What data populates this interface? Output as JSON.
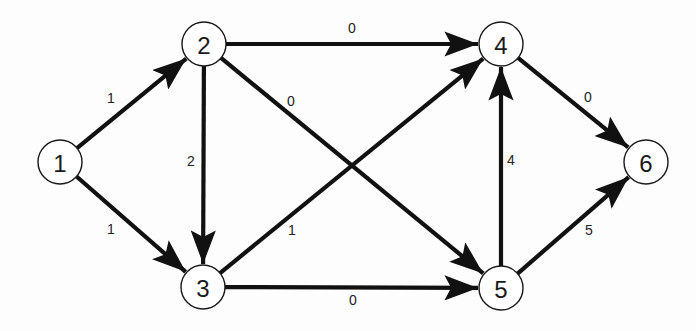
{
  "diagram": {
    "type": "directed-weighted-graph",
    "colors": {
      "edge": "#111111",
      "node_stroke": "#1a1a1a",
      "node_fill": "#ffffff",
      "text": "#1a1a1a",
      "background": "#fdfdfd"
    },
    "nodes": [
      {
        "id": "1",
        "label": "1",
        "x": 60,
        "y": 162
      },
      {
        "id": "2",
        "label": "2",
        "x": 204,
        "y": 44
      },
      {
        "id": "3",
        "label": "3",
        "x": 203,
        "y": 287
      },
      {
        "id": "4",
        "label": "4",
        "x": 501,
        "y": 44
      },
      {
        "id": "5",
        "label": "5",
        "x": 501,
        "y": 288
      },
      {
        "id": "6",
        "label": "6",
        "x": 646,
        "y": 162
      }
    ],
    "edges": [
      {
        "from": "1",
        "to": "2",
        "weight": "1",
        "label_x": 111,
        "label_y": 98
      },
      {
        "from": "1",
        "to": "3",
        "weight": "1",
        "label_x": 111,
        "label_y": 229
      },
      {
        "from": "2",
        "to": "3",
        "weight": "2",
        "label_x": 191,
        "label_y": 161
      },
      {
        "from": "2",
        "to": "4",
        "weight": "0",
        "label_x": 352,
        "label_y": 28
      },
      {
        "from": "2",
        "to": "5",
        "weight": "0",
        "label_x": 291,
        "label_y": 101
      },
      {
        "from": "3",
        "to": "4",
        "weight": "1",
        "label_x": 292,
        "label_y": 230
      },
      {
        "from": "3",
        "to": "5",
        "weight": "0",
        "label_x": 353,
        "label_y": 300
      },
      {
        "from": "5",
        "to": "4",
        "weight": "4",
        "label_x": 511,
        "label_y": 160
      },
      {
        "from": "4",
        "to": "6",
        "weight": "0",
        "label_x": 588,
        "label_y": 97
      },
      {
        "from": "5",
        "to": "6",
        "weight": "5",
        "label_x": 589,
        "label_y": 230
      }
    ]
  }
}
